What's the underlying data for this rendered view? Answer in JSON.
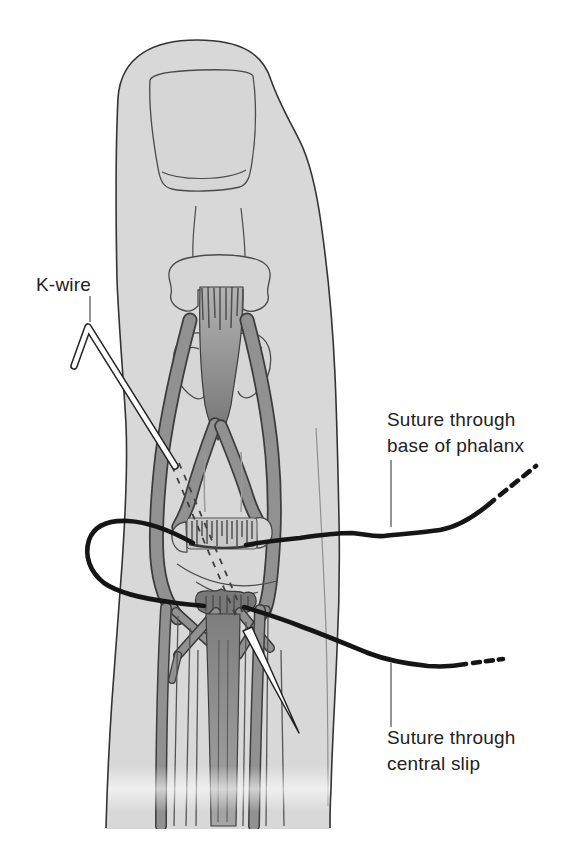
{
  "labels": {
    "kwire": "K-wire",
    "suture_base_of_phalanx": "Suture through\nbase of phalanx",
    "suture_central_slip": "Suture through\ncentral slip"
  },
  "colors": {
    "background": "#ffffff",
    "skin": "#d8d8d8",
    "bone": "#d6d6d6",
    "tendon": "#919191",
    "tendon_dark": "#787878",
    "outline": "#333333",
    "suture": "#151515",
    "kwire_metal": "#ffffff",
    "label_text": "#222222"
  }
}
